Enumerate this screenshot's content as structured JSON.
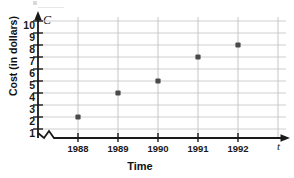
{
  "chart_data": {
    "type": "scatter",
    "title": "",
    "subtitle": "",
    "xlabel": "Time",
    "ylabel": "Cost (in dollars)",
    "x_axis_variable": "t",
    "y_axis_variable": "C",
    "categories": [
      "1988",
      "1989",
      "1990",
      "1991",
      "1992"
    ],
    "x": [
      1988,
      1989,
      1990,
      1991,
      1992
    ],
    "values": [
      2,
      4,
      5,
      7,
      8
    ],
    "points": [
      {
        "x": "1988",
        "y": 2
      },
      {
        "x": "1989",
        "y": 4
      },
      {
        "x": "1990",
        "y": 5
      },
      {
        "x": "1991",
        "y": 7
      },
      {
        "x": "1992",
        "y": 8
      }
    ],
    "ylim": [
      0,
      10
    ],
    "yticks": [
      10,
      9,
      8,
      7,
      6,
      5,
      4,
      3,
      2,
      1
    ],
    "xticks": [
      "1988",
      "1989",
      "1990",
      "1991",
      "1992"
    ],
    "grid": true,
    "grid_color": "#cfcfcf",
    "axis_color": "#1a1a1a",
    "marker_color": "#4a4a4a",
    "legend": [],
    "legend_position": "none",
    "annotations": [
      "axis break on horizontal axis near origin"
    ]
  }
}
